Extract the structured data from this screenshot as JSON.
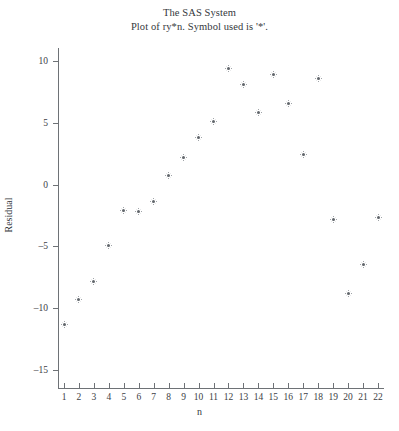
{
  "titles": {
    "line1": "The SAS System",
    "line2": "Plot of ry*n. Symbol used is '*'."
  },
  "axes": {
    "xlabel": "n",
    "ylabel": "Residual"
  },
  "chart_data": {
    "type": "scatter",
    "title": "The SAS System",
    "subtitle": "Plot of ry*n. Symbol used is '*'.",
    "xlabel": "n",
    "ylabel": "Residual",
    "marker_symbol": "*",
    "marker_color": "#60656a",
    "grid": false,
    "legend": null,
    "xlim": [
      0.35,
      22.65
    ],
    "ylim": [
      -16.0,
      11.5
    ],
    "xticks": [
      1,
      2,
      3,
      4,
      5,
      6,
      7,
      8,
      9,
      10,
      11,
      12,
      13,
      14,
      15,
      16,
      17,
      18,
      19,
      20,
      21,
      22
    ],
    "xticklabels": [
      "1",
      "2",
      "3",
      "4",
      "5",
      "6",
      "7",
      "8",
      "9",
      "10",
      "11",
      "12",
      "13",
      "14",
      "15",
      "16",
      "17",
      "18",
      "19",
      "20",
      "21",
      "22"
    ],
    "yticks": [
      10,
      5,
      0,
      -5,
      -10,
      -15
    ],
    "yticklabels": [
      "10",
      "5",
      "0",
      "–5",
      "–10",
      "–15"
    ],
    "x": [
      1,
      2,
      3,
      4,
      5,
      6,
      7,
      8,
      9,
      10,
      11,
      12,
      13,
      14,
      15,
      16,
      17,
      18,
      19,
      20,
      21,
      22
    ],
    "y": [
      -11.3,
      -9.3,
      -7.8,
      -4.9,
      -2.1,
      -2.2,
      -1.4,
      0.7,
      2.2,
      3.8,
      5.1,
      9.4,
      8.1,
      5.8,
      8.9,
      6.6,
      2.4,
      8.6,
      -2.8,
      -8.8,
      -6.5,
      -2.7
    ],
    "points": [
      {
        "n": 1,
        "residual": -11.3
      },
      {
        "n": 2,
        "residual": -9.3
      },
      {
        "n": 3,
        "residual": -7.8
      },
      {
        "n": 4,
        "residual": -4.9
      },
      {
        "n": 5,
        "residual": -2.1
      },
      {
        "n": 6,
        "residual": -2.2
      },
      {
        "n": 7,
        "residual": -1.4
      },
      {
        "n": 8,
        "residual": 0.7
      },
      {
        "n": 9,
        "residual": 2.2
      },
      {
        "n": 10,
        "residual": 3.8
      },
      {
        "n": 11,
        "residual": 5.1
      },
      {
        "n": 12,
        "residual": 9.4
      },
      {
        "n": 13,
        "residual": 8.1
      },
      {
        "n": 14,
        "residual": 5.8
      },
      {
        "n": 15,
        "residual": 8.9
      },
      {
        "n": 16,
        "residual": 6.6
      },
      {
        "n": 17,
        "residual": 2.4
      },
      {
        "n": 18,
        "residual": 8.6
      },
      {
        "n": 19,
        "residual": -2.8
      },
      {
        "n": 20,
        "residual": -8.8
      },
      {
        "n": 21,
        "residual": -6.5
      },
      {
        "n": 22,
        "residual": -2.7
      }
    ]
  }
}
